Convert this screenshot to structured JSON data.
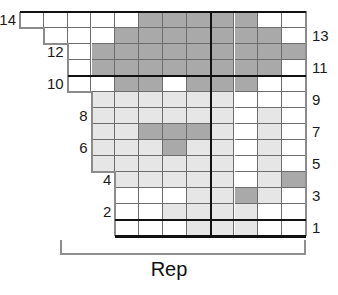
{
  "chart_data": {
    "type": "heatmap",
    "title": "",
    "xlabel": "Rep",
    "ylabel": "",
    "grid": true,
    "legend": null,
    "columns": 12,
    "rows": 14,
    "row_order": "bottom-to-top",
    "row_labels_left": [
      "14",
      "12",
      "10",
      "8",
      "6",
      "4",
      "2"
    ],
    "row_labels_right": [
      "13",
      "11",
      "9",
      "7",
      "5",
      "3",
      "1"
    ],
    "value_key": {
      "0": "empty",
      "1": "white",
      "2": "light-gray",
      "3": "dark-gray"
    },
    "colors": {
      "white": "#ffffff",
      "light_gray": "#e6e6e6",
      "dark_gray": "#a9a9a9",
      "grid_line": "#6d6d6d",
      "heavy_line": "#111111",
      "outline": "#8c8c8c"
    },
    "repeat_marker_after_column": 8,
    "heavy_horizontal_rules_above_rows": [
      1,
      10,
      14
    ],
    "cells": [
      [
        1,
        1,
        1,
        1,
        1,
        3,
        3,
        3,
        3,
        3,
        1,
        1
      ],
      [
        1,
        1,
        1,
        1,
        3,
        3,
        3,
        3,
        3,
        3,
        3,
        1
      ],
      [
        1,
        1,
        1,
        3,
        3,
        3,
        3,
        3,
        3,
        3,
        3,
        3
      ],
      [
        1,
        1,
        1,
        3,
        3,
        3,
        3,
        3,
        3,
        3,
        3,
        1
      ],
      [
        1,
        1,
        1,
        1,
        3,
        3,
        1,
        3,
        3,
        3,
        1,
        1
      ],
      [
        1,
        1,
        1,
        2,
        2,
        2,
        2,
        2,
        2,
        1,
        1,
        1
      ],
      [
        1,
        1,
        2,
        2,
        2,
        2,
        2,
        2,
        2,
        1,
        2,
        1
      ],
      [
        1,
        1,
        2,
        2,
        2,
        3,
        3,
        3,
        2,
        1,
        2,
        1
      ],
      [
        1,
        1,
        2,
        2,
        2,
        2,
        3,
        2,
        2,
        1,
        2,
        1
      ],
      [
        1,
        1,
        2,
        2,
        2,
        2,
        2,
        2,
        2,
        1,
        2,
        1
      ],
      [
        1,
        2,
        2,
        2,
        2,
        2,
        2,
        2,
        2,
        1,
        2,
        3
      ],
      [
        1,
        1,
        1,
        1,
        1,
        1,
        1,
        2,
        2,
        3,
        2,
        1
      ],
      [
        1,
        1,
        1,
        1,
        1,
        1,
        2,
        2,
        2,
        2,
        1,
        1
      ],
      [
        1,
        1,
        1,
        1,
        1,
        1,
        1,
        2,
        2,
        2,
        1,
        1
      ]
    ],
    "row_start_column": [
      1,
      2,
      3,
      3,
      3,
      4,
      4,
      4,
      4,
      4,
      5,
      5,
      5,
      5
    ]
  },
  "labels": {
    "rep": "Rep"
  },
  "icons": {
    "repeat_bracket": "repeat-bracket-icon"
  }
}
